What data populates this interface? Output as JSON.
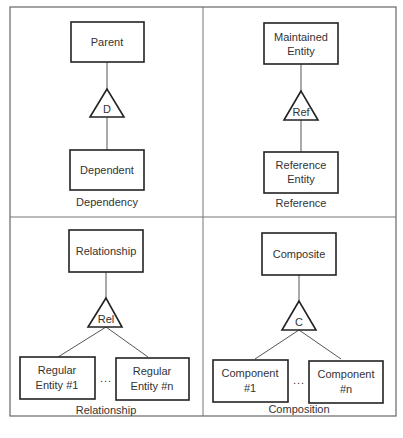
{
  "diagram": {
    "quadrants": [
      {
        "name": "dependency",
        "parent": [
          "Parent"
        ],
        "symbol": "D",
        "children": [
          [
            "Dependent"
          ]
        ],
        "caption": "Dependency"
      },
      {
        "name": "reference",
        "parent": [
          "Maintained",
          "Entity"
        ],
        "symbol": "Ref",
        "children": [
          [
            "Reference",
            "Entity"
          ]
        ],
        "caption": "Reference"
      },
      {
        "name": "relationship",
        "parent": [
          "Relationship"
        ],
        "symbol": "Rel",
        "children": [
          [
            "Regular",
            "Entity #1"
          ],
          [
            "Regular",
            "Entity #n"
          ]
        ],
        "ellipsis": "...",
        "caption": "Relationship"
      },
      {
        "name": "composition",
        "parent": [
          "Composite"
        ],
        "symbol": "C",
        "children": [
          [
            "Component",
            "#1"
          ],
          [
            "Component",
            "#n"
          ]
        ],
        "ellipsis": "...",
        "caption": "Composition"
      }
    ]
  }
}
